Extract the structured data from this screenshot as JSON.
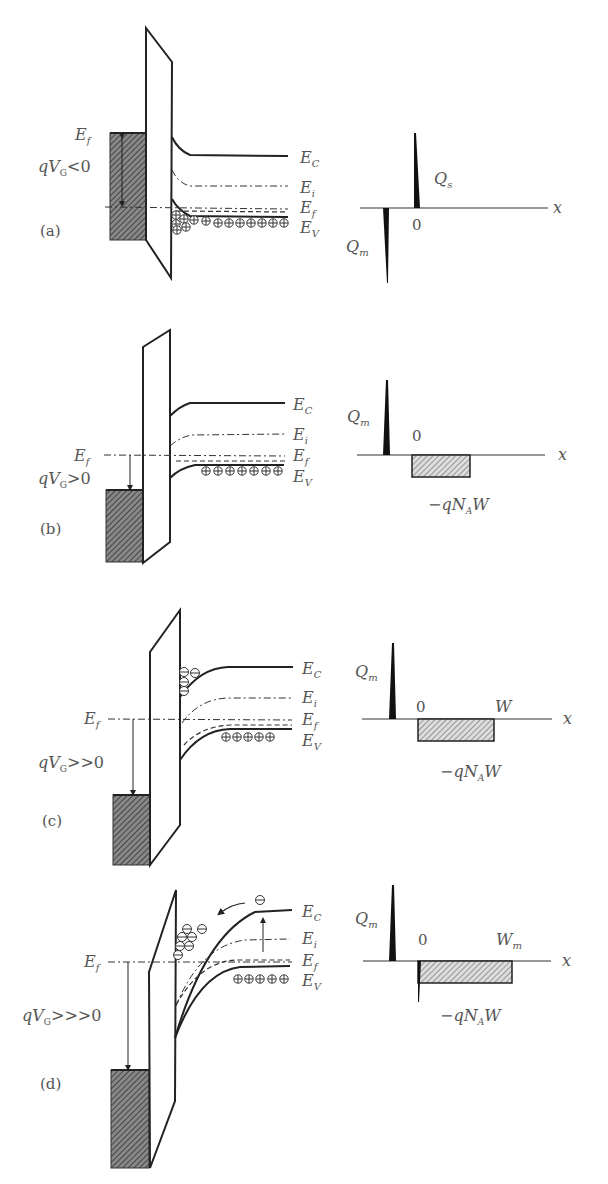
{
  "figure": {
    "panels": [
      {
        "id": "a",
        "label": "(a)",
        "condition": "qV_G<0",
        "bias_label_main": "qV",
        "bias_label_sub": "G",
        "bias_label_rel": "<0",
        "regime": "accumulation",
        "band_labels": {
          "ec": "E",
          "ec_sub": "C",
          "ei": "E",
          "ei_sub": "i",
          "ef": "E",
          "ef_sub": "f",
          "ev": "E",
          "ev_sub": "V"
        },
        "metal_ef": {
          "main": "E",
          "sub": "f"
        },
        "charge": {
          "qm": "Q",
          "qm_sub": "m",
          "qs": "Q",
          "qs_sub": "s",
          "origin": "0",
          "axis": "x"
        }
      },
      {
        "id": "b",
        "label": "(b)",
        "condition": "qV_G>0",
        "bias_label_main": "qV",
        "bias_label_sub": "G",
        "bias_label_rel": ">0",
        "regime": "depletion",
        "band_labels": {
          "ec": "E",
          "ec_sub": "C",
          "ei": "E",
          "ei_sub": "i",
          "ef": "E",
          "ef_sub": "f",
          "ev": "E",
          "ev_sub": "V"
        },
        "metal_ef": {
          "main": "E",
          "sub": "f"
        },
        "charge": {
          "qm": "Q",
          "qm_sub": "m",
          "origin": "0",
          "axis": "x",
          "depl_pre": "−qN",
          "depl_sub": "A",
          "depl_post": "W"
        }
      },
      {
        "id": "c",
        "label": "(c)",
        "condition": "qV_G>>0",
        "bias_label_main": "qV",
        "bias_label_sub": "G",
        "bias_label_rel": ">>0",
        "regime": "weak inversion",
        "band_labels": {
          "ec": "E",
          "ec_sub": "C",
          "ei": "E",
          "ei_sub": "i",
          "ef": "E",
          "ef_sub": "f",
          "ev": "E",
          "ev_sub": "V"
        },
        "metal_ef": {
          "main": "E",
          "sub": "f"
        },
        "charge": {
          "qm": "Q",
          "qm_sub": "m",
          "origin": "0",
          "width": "W",
          "axis": "x",
          "depl_pre": "−qN",
          "depl_sub": "A",
          "depl_post": "W"
        }
      },
      {
        "id": "d",
        "label": "(d)",
        "condition": "qV_G>>>0",
        "bias_label_main": "qV",
        "bias_label_sub": "G",
        "bias_label_rel": ">>>0",
        "regime": "strong inversion",
        "band_labels": {
          "ec": "E",
          "ec_sub": "C",
          "ei": "E",
          "ei_sub": "i",
          "ef": "E",
          "ef_sub": "f",
          "ev": "E",
          "ev_sub": "V"
        },
        "metal_ef": {
          "main": "E",
          "sub": "f"
        },
        "charge": {
          "qm": "Q",
          "qm_sub": "m",
          "origin": "0",
          "width": "W",
          "width_sub": "m",
          "axis": "x",
          "depl_pre": "−qN",
          "depl_sub": "A",
          "depl_post": "W"
        }
      }
    ],
    "symbols": {
      "hole": "⊕",
      "electron": "⊖"
    }
  }
}
